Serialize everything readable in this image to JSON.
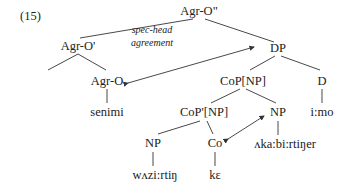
{
  "example_number": "(15)",
  "annotation": {
    "line1": "spec-head",
    "line2": "agreement"
  },
  "nodes": {
    "root": "Agr-O\"",
    "agr_o_bar": "Agr-O'",
    "dp": "DP",
    "agr_o": "Agr-O",
    "cop_np": "CoP[NP]",
    "d": "D",
    "senimi": "senimi",
    "cop_bar_np": "CoP'[NP]",
    "np_right": "NP",
    "imo": "i:mo",
    "np_left": "NP",
    "co": "Co",
    "akabirtiner": "ʌka:bi:rtiŋer",
    "wazirtin": "wʌzi:rtiŋ",
    "ke": "kɛ"
  },
  "colors": {
    "line": "#333333",
    "text": "#222222"
  }
}
